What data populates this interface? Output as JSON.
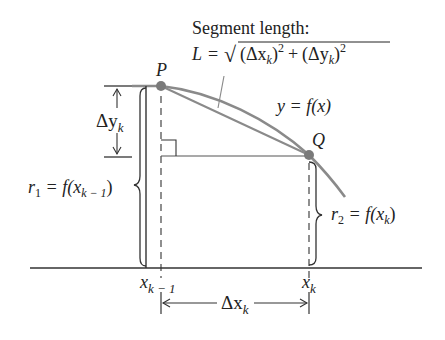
{
  "title": "Segment length:",
  "formula": {
    "lhs": "L",
    "eq": "=",
    "radical": "√",
    "term1": "(Δx",
    "term1_sub": "k",
    "term1_close": ")",
    "term1_exp": "2",
    "plus": "+",
    "term2": "(Δy",
    "term2_sub": "k",
    "term2_close": ")",
    "term2_exp": "2"
  },
  "points": {
    "P": "P",
    "Q": "Q"
  },
  "curve_label": "y = f(x)",
  "delta_y": {
    "main": "Δy",
    "sub": "k"
  },
  "r1": {
    "main": "r",
    "sub": "1",
    "rest": " = f(x",
    "arg_sub": "k − 1",
    "close": ")"
  },
  "r2": {
    "main": "r",
    "sub": "2",
    "rest": " = f(x",
    "arg_sub": "k",
    "close": ")"
  },
  "x_ticks": {
    "left": {
      "main": "x",
      "sub": "k − 1"
    },
    "right": {
      "main": "x",
      "sub": "k"
    }
  },
  "delta_x": {
    "main": "Δx",
    "sub": "k"
  },
  "colors": {
    "curve": "#8a8a8a",
    "ink": "#222222",
    "point": "#7a7a7a"
  }
}
